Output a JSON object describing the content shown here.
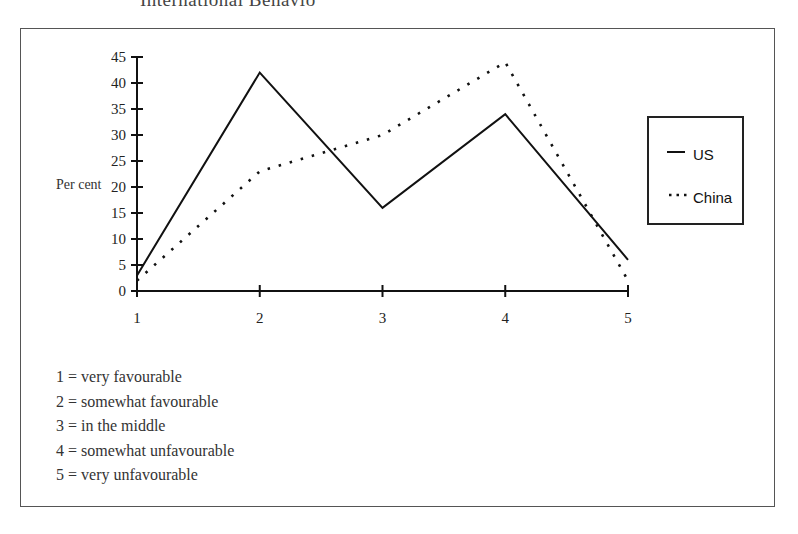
{
  "page": {
    "heading_partial": "International Behavio"
  },
  "chart_data": {
    "type": "line",
    "title": "",
    "xlabel": "",
    "ylabel": "Per cent",
    "categories": [
      "1",
      "2",
      "3",
      "4",
      "5"
    ],
    "x": [
      1,
      2,
      3,
      4,
      5
    ],
    "series": [
      {
        "name": "US",
        "style": "solid",
        "color": "#111111",
        "values": [
          3,
          42,
          16,
          34,
          6
        ]
      },
      {
        "name": "China",
        "style": "dotted",
        "color": "#111111",
        "values": [
          2,
          23,
          30,
          44,
          2
        ]
      }
    ],
    "ylim": [
      0,
      45
    ],
    "yticks": [
      0,
      5,
      10,
      15,
      20,
      25,
      30,
      35,
      40,
      45
    ],
    "xticks": [
      1,
      2,
      3,
      4,
      5
    ],
    "grid": false,
    "legend_position": "right",
    "annotations": [
      "1 = very favourable",
      "2 = somewhat favourable",
      "3 = in the middle",
      "4 = somewhat unfavourable",
      "5 = very unfavourable"
    ]
  },
  "legend": {
    "items": [
      {
        "label": "US",
        "line_style": "solid"
      },
      {
        "label": "China",
        "line_style": "dotted"
      }
    ]
  },
  "key": {
    "items": [
      "1 = very favourable",
      "2 = somewhat favourable",
      "3 = in the middle",
      "4 = somewhat unfavourable",
      "5 = very unfavourable"
    ]
  }
}
